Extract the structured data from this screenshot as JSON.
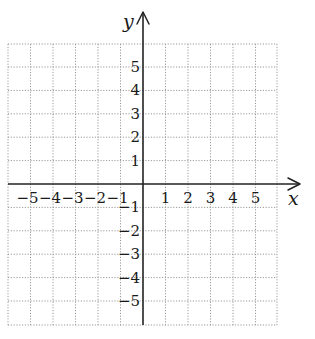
{
  "chart_data": {
    "type": "scatter",
    "title": "",
    "xlabel": "x",
    "ylabel": "y",
    "xlim": [
      -6,
      6
    ],
    "ylim": [
      -6,
      6
    ],
    "grid": true,
    "grid_style": "dotted",
    "legend": null,
    "x_ticks": [
      -5,
      -4,
      -3,
      -2,
      -1,
      1,
      2,
      3,
      4,
      5
    ],
    "y_ticks": [
      -5,
      -4,
      -3,
      -2,
      -1,
      1,
      2,
      3,
      4,
      5
    ],
    "x_tick_labels": [
      "−5",
      "−4",
      "−3",
      "−2",
      "−1",
      "1",
      "2",
      "3",
      "4",
      "5"
    ],
    "y_tick_labels": [
      "−5",
      "−4",
      "−3",
      "−2",
      "−1",
      "1",
      "2",
      "3",
      "4",
      "5"
    ],
    "series": [],
    "annotations": []
  },
  "layout": {
    "grid_left": 8,
    "grid_right": 277,
    "grid_top": 44,
    "grid_bottom": 325,
    "origin_x": 143,
    "origin_y": 184,
    "unit_x": 22.5,
    "unit_y": 23.4,
    "x_axis_end": 300,
    "y_axis_top": 12
  },
  "colors": {
    "axis": "#222222",
    "grid": "#9a9a9a",
    "text": "#1a1a1a",
    "background": "#ffffff"
  }
}
